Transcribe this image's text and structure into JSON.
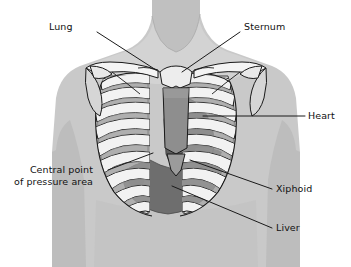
{
  "figure": {
    "type": "anatomical-diagram",
    "background_color": "#ffffff"
  },
  "palette": {
    "background": "#ffffff",
    "body_fill": "#c9c9c9",
    "body_shadow": "#b4b4b4",
    "body_highlight": "#d8d8d8",
    "neck_fill": "#c2c2c2",
    "bone_fill": "#f2f2f2",
    "bone_stroke": "#1a1a1a",
    "intercostal": "#a8a8a8",
    "sternum_fill": "#8e8e8e",
    "heart_fill": "#5e5e5e",
    "liver_fill": "#6e6e6e",
    "lung_fill": "#dcdcdc",
    "leader_line": "#1a1a1a",
    "label_text": "#111111"
  },
  "labels": [
    {
      "id": "lung",
      "text": "Lung",
      "side": "left",
      "x": 62,
      "y": 26,
      "leader": {
        "x1": 97,
        "y1": 32,
        "x2": 156,
        "y2": 70
      }
    },
    {
      "id": "sternum",
      "text": "Sternum",
      "side": "right",
      "x": 244,
      "y": 26,
      "leader": {
        "x1": 240,
        "y1": 32,
        "x2": 182,
        "y2": 72
      }
    },
    {
      "id": "heart",
      "text": "Heart",
      "side": "right",
      "x": 308,
      "y": 110,
      "leader": {
        "x1": 305,
        "y1": 116,
        "x2": 203,
        "y2": 116
      }
    },
    {
      "id": "central-point",
      "text": "Central point\nof pressure area",
      "side": "left",
      "x": 20,
      "y": 164,
      "leader": {
        "x1": 108,
        "y1": 170,
        "x2": 153,
        "y2": 153
      }
    },
    {
      "id": "xiphoid",
      "text": "Xiphoid",
      "side": "right",
      "x": 276,
      "y": 183,
      "leader": {
        "x1": 272,
        "y1": 189,
        "x2": 190,
        "y2": 160
      }
    },
    {
      "id": "liver",
      "text": "Liver",
      "side": "right",
      "x": 276,
      "y": 222,
      "leader": {
        "x1": 272,
        "y1": 228,
        "x2": 172,
        "y2": 186
      }
    }
  ],
  "structures": [
    {
      "id": "torso",
      "name": "torso-silhouette"
    },
    {
      "id": "neck",
      "name": "neck"
    },
    {
      "id": "ribcage",
      "name": "ribcage"
    },
    {
      "id": "clavicle-left",
      "name": "clavicle-left"
    },
    {
      "id": "clavicle-right",
      "name": "clavicle-right"
    },
    {
      "id": "scapula-left",
      "name": "scapula-left"
    },
    {
      "id": "scapula-right",
      "name": "scapula-right"
    },
    {
      "id": "sternum",
      "name": "sternum"
    },
    {
      "id": "xiphoid",
      "name": "xiphoid-process"
    },
    {
      "id": "heart",
      "name": "heart"
    },
    {
      "id": "liver",
      "name": "liver"
    },
    {
      "id": "lung-left",
      "name": "lung-left"
    },
    {
      "id": "lung-right",
      "name": "lung-right"
    }
  ]
}
